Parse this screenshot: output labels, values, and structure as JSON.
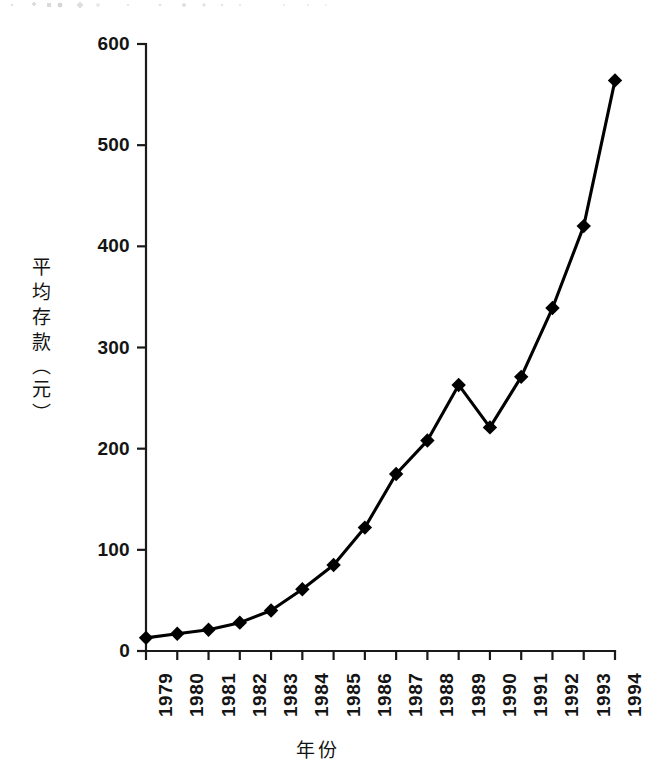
{
  "chart_data": {
    "type": "line",
    "title": "",
    "subtitle": "",
    "xlabel": "年份",
    "ylabel": "平均存款（元）",
    "ylabel_chars": [
      "平",
      "均",
      "存",
      "款",
      "（",
      "元",
      "）"
    ],
    "categories": [
      "1979",
      "1980",
      "1981",
      "1982",
      "1983",
      "1984",
      "1985",
      "1986",
      "1987",
      "1988",
      "1989",
      "1990",
      "1991",
      "1992",
      "1993",
      "1994"
    ],
    "values": [
      13,
      17,
      21,
      28,
      40,
      61,
      85,
      122,
      175,
      208,
      263,
      221,
      271,
      339,
      420,
      564
    ],
    "series": [
      {
        "name": "平均存款",
        "values": [
          13,
          17,
          21,
          28,
          40,
          61,
          85,
          122,
          175,
          208,
          263,
          221,
          271,
          339,
          420,
          564
        ]
      }
    ],
    "ylim": [
      0,
      600
    ],
    "yticks": [
      0,
      100,
      200,
      300,
      400,
      500,
      600
    ],
    "ytick_labels": [
      "0",
      "100",
      "200",
      "300",
      "400",
      "500",
      "600"
    ],
    "xtick_labels": [
      "1979",
      "1980",
      "1981",
      "1982",
      "1983",
      "1984",
      "1985",
      "1986",
      "1987",
      "1988",
      "1989",
      "1990",
      "1991",
      "1992",
      "1993",
      "1994"
    ],
    "grid": false,
    "legend": false,
    "legend_position": "none",
    "marker": "diamond",
    "line_color": "#000000",
    "marker_color": "#000000",
    "background_color": "#ffffff",
    "annotations": []
  },
  "layout": {
    "plot_left": 146,
    "plot_right": 615,
    "plot_top": 44,
    "plot_bottom": 651
  }
}
